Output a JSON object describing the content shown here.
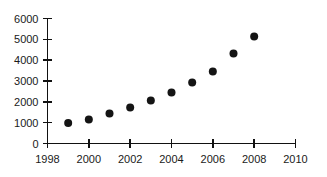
{
  "chart_data": {
    "type": "scatter",
    "title": "",
    "subtitle": "",
    "xlabel": "",
    "ylabel": "",
    "x": [
      1999,
      2000,
      2001,
      2002,
      2003,
      2004,
      2005,
      2006,
      2007,
      2008
    ],
    "values": [
      990,
      1150,
      1440,
      1730,
      2060,
      2450,
      2930,
      3460,
      4320,
      5140
    ],
    "series": [
      {
        "name": "series-1",
        "x": [
          1999,
          2000,
          2001,
          2002,
          2003,
          2004,
          2005,
          2006,
          2007,
          2008
        ],
        "values": [
          990,
          1150,
          1440,
          1730,
          2060,
          2450,
          2930,
          3460,
          4320,
          5140
        ]
      }
    ],
    "xlim": [
      1998,
      2010
    ],
    "ylim": [
      0,
      6000
    ],
    "xticks": [
      1998,
      2000,
      2002,
      2004,
      2006,
      2008,
      2010
    ],
    "xticklabels": [
      "1998",
      "2000",
      "2002",
      "2004",
      "2006",
      "2008",
      "2010"
    ],
    "yticks": [
      0,
      1000,
      2000,
      3000,
      4000,
      5000,
      6000
    ],
    "yticklabels": [
      "0",
      "1000",
      "2000",
      "3000",
      "4000",
      "5000",
      "6000"
    ],
    "grid": false,
    "legend": false,
    "legend_position": "none",
    "marker": "circle",
    "marker_color": "#141414",
    "marker_size": 7,
    "background_color": "#ffffff",
    "axis_color": "#111111",
    "annotations": []
  }
}
